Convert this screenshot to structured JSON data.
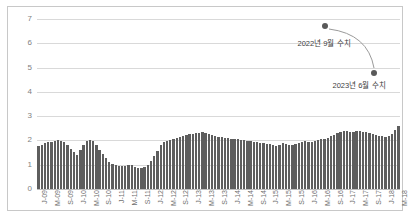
{
  "chart_data": {
    "type": "bar",
    "title": "",
    "xlabel": "",
    "ylabel": "",
    "ylim": [
      0,
      7
    ],
    "yticks": [
      0,
      1,
      2,
      3,
      4,
      5,
      6,
      7
    ],
    "grid": true,
    "legend": null,
    "bar_color": "#5e5e5e",
    "categories": [
      "J-09",
      "F-09",
      "M-09",
      "A-09",
      "M-09b",
      "J-09b",
      "J-09c",
      "A-09b",
      "S-09",
      "O-09",
      "N-09",
      "D-09",
      "J-10",
      "F-10",
      "M-10",
      "A-10",
      "M-10b",
      "J-10b",
      "J-10c",
      "A-10b",
      "S-10",
      "O-10",
      "N-10",
      "D-10",
      "J-11",
      "F-11",
      "M-11",
      "A-11",
      "M-11b",
      "J-11b",
      "J-11c",
      "A-11b",
      "S-11",
      "O-11",
      "N-11",
      "D-11",
      "J-12",
      "F-12",
      "M-12",
      "A-12",
      "M-12b",
      "J-12b",
      "J-12c",
      "A-12b",
      "S-12",
      "O-12",
      "N-12",
      "D-12",
      "J-13",
      "F-13",
      "M-13",
      "A-13",
      "M-13b",
      "J-13b",
      "J-13c",
      "A-13b",
      "S-13",
      "O-13",
      "N-13",
      "D-13",
      "J-14",
      "F-14",
      "M-14",
      "A-14",
      "M-14b",
      "J-14b",
      "J-14c",
      "A-14b",
      "S-14",
      "O-14",
      "N-14",
      "D-14",
      "J-15",
      "F-15",
      "M-15",
      "A-15",
      "M-15b",
      "J-15b",
      "J-15c",
      "A-15b",
      "S-15",
      "O-15",
      "N-15",
      "D-15",
      "J-16",
      "F-16",
      "M-16",
      "A-16",
      "M-16b",
      "J-16b",
      "J-16c",
      "A-16b",
      "S-16",
      "O-16",
      "N-16",
      "D-16",
      "J-17",
      "F-17",
      "M-17",
      "A-17",
      "M-17b",
      "J-17b",
      "J-17c",
      "A-17b",
      "S-17",
      "O-17",
      "N-17",
      "D-17",
      "J-18",
      "F-18",
      "M-18",
      "A-18",
      "M-18b"
    ],
    "tick_labels": [
      {
        "index": 0,
        "label": "J-09"
      },
      {
        "index": 4,
        "label": "M-09"
      },
      {
        "index": 8,
        "label": "S-09"
      },
      {
        "index": 12,
        "label": "J-10"
      },
      {
        "index": 16,
        "label": "M-10"
      },
      {
        "index": 20,
        "label": "S-10"
      },
      {
        "index": 24,
        "label": "J-11"
      },
      {
        "index": 28,
        "label": "M-11"
      },
      {
        "index": 32,
        "label": "S-11"
      },
      {
        "index": 36,
        "label": "J-12"
      },
      {
        "index": 40,
        "label": "M-12"
      },
      {
        "index": 44,
        "label": "S-12"
      },
      {
        "index": 48,
        "label": "J-13"
      },
      {
        "index": 52,
        "label": "M-13"
      },
      {
        "index": 56,
        "label": "S-13"
      },
      {
        "index": 60,
        "label": "J-14"
      },
      {
        "index": 64,
        "label": "M-14"
      },
      {
        "index": 68,
        "label": "S-14"
      },
      {
        "index": 72,
        "label": "J-15"
      },
      {
        "index": 76,
        "label": "M-15"
      },
      {
        "index": 80,
        "label": "S-15"
      },
      {
        "index": 84,
        "label": "J-16"
      },
      {
        "index": 88,
        "label": "M-16"
      },
      {
        "index": 92,
        "label": "S-16"
      },
      {
        "index": 96,
        "label": "J-17"
      },
      {
        "index": 100,
        "label": "M-17"
      },
      {
        "index": 104,
        "label": "S-17"
      },
      {
        "index": 108,
        "label": "J-18"
      },
      {
        "index": 112,
        "label": "M-18"
      }
    ],
    "values": [
      1.78,
      1.82,
      1.88,
      1.92,
      1.95,
      1.98,
      2.0,
      1.98,
      1.92,
      1.8,
      1.66,
      1.52,
      1.4,
      1.6,
      1.82,
      1.98,
      2.02,
      1.96,
      1.8,
      1.62,
      1.44,
      1.28,
      1.12,
      1.02,
      0.98,
      0.96,
      0.95,
      0.96,
      0.98,
      1.0,
      0.92,
      0.88,
      0.86,
      0.9,
      1.0,
      1.14,
      1.34,
      1.58,
      1.8,
      1.92,
      1.98,
      2.02,
      2.06,
      2.1,
      2.14,
      2.18,
      2.22,
      2.26,
      2.28,
      2.3,
      2.32,
      2.34,
      2.32,
      2.28,
      2.24,
      2.2,
      2.16,
      2.14,
      2.12,
      2.1,
      2.08,
      2.06,
      2.04,
      2.02,
      2.0,
      1.98,
      1.96,
      1.94,
      1.92,
      1.9,
      1.88,
      1.86,
      1.84,
      1.8,
      1.76,
      1.82,
      1.88,
      1.84,
      1.8,
      1.82,
      1.86,
      1.9,
      1.94,
      1.96,
      1.94,
      1.92,
      1.96,
      2.0,
      2.04,
      2.08,
      2.12,
      2.18,
      2.24,
      2.3,
      2.36,
      2.4,
      2.38,
      2.34,
      2.36,
      2.4,
      2.38,
      2.34,
      2.36,
      2.32,
      2.28,
      2.24,
      2.2,
      2.18,
      2.16,
      2.2,
      2.28,
      2.42,
      2.58
    ],
    "annotations": [
      {
        "id": "peak-2022",
        "label": "2022년 9월 수치",
        "marker_x_px": 325,
        "marker_y_px": 26,
        "label_x_px": 324,
        "label_y_px": 44
      },
      {
        "id": "trough-2023",
        "label": "2023년 6월 수치",
        "marker_x_px": 374,
        "marker_y_px": 73,
        "label_x_px": 359,
        "label_y_px": 86
      }
    ],
    "annotation_connector": {
      "from_x": 329,
      "from_y": 29,
      "ctrl_x": 368,
      "ctrl_y": 34,
      "to_x": 374,
      "to_y": 68
    }
  }
}
